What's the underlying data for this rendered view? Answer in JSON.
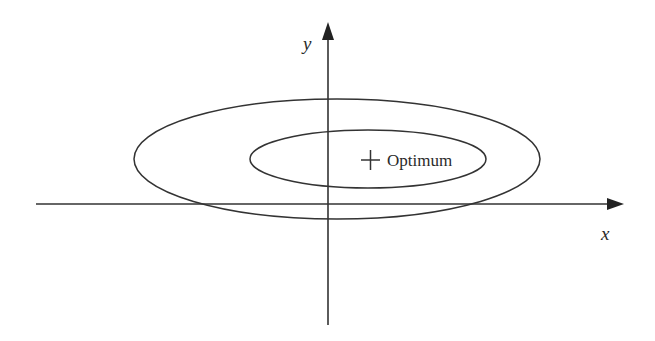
{
  "diagram": {
    "axes": {
      "x_label": "x",
      "y_label": "y"
    },
    "marker": {
      "symbol": "+",
      "label": "Optimum"
    },
    "contours": [
      {
        "name": "outer-contour"
      },
      {
        "name": "inner-contour"
      }
    ],
    "colors": {
      "stroke": "#333333",
      "background": "#ffffff"
    }
  }
}
